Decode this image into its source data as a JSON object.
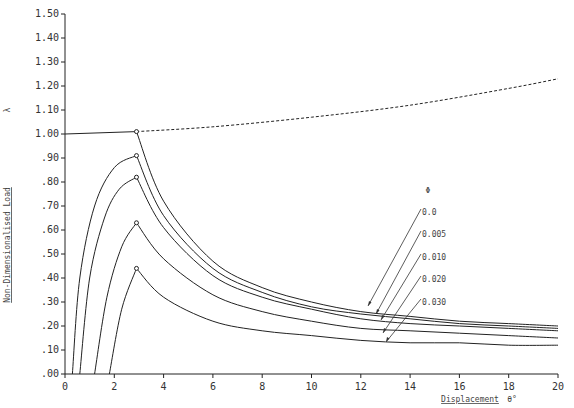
{
  "chart_data": {
    "type": "line",
    "title": "",
    "xlabel": "Displacement",
    "xlabel_unit": "θ°",
    "ylabel": "Non-Dimensionalised Load",
    "ylabel_symbol": "λ",
    "xlim": [
      0,
      20
    ],
    "ylim": [
      0,
      1.5
    ],
    "x_ticks": [
      "0",
      "2",
      "4",
      "6",
      "8",
      "10",
      "12",
      "14",
      "16",
      "18",
      "20"
    ],
    "y_ticks": [
      ".00",
      ".10",
      ".20",
      ".30",
      ".40",
      ".50",
      ".60",
      ".70",
      ".80",
      ".90",
      "1.00",
      "1.10",
      "1.20",
      "1.30",
      "1.40",
      "1.50"
    ],
    "grid": false,
    "legend": {
      "title": "Φ",
      "entries": [
        "0.0",
        "0.005",
        "0.010",
        "0.020",
        "0.030"
      ],
      "position": "right, with leader arrows to curves"
    },
    "series": [
      {
        "name": "perfect (Φ=0) pre-buckling",
        "style": "solid",
        "x": [
          0,
          2.9
        ],
        "y": [
          1.0,
          1.01
        ]
      },
      {
        "name": "post-buckling rising path",
        "style": "dashed",
        "x": [
          2.9,
          6,
          10,
          14,
          18,
          20
        ],
        "y": [
          1.01,
          1.03,
          1.07,
          1.12,
          1.19,
          1.23
        ]
      },
      {
        "name": "0.0",
        "style": "solid",
        "x": [
          2.9,
          4,
          6,
          8,
          10,
          12,
          14,
          16,
          18,
          20
        ],
        "y": [
          1.01,
          0.72,
          0.47,
          0.36,
          0.3,
          0.26,
          0.24,
          0.22,
          0.21,
          0.2
        ]
      },
      {
        "name": "0.005",
        "style": "solid",
        "x": [
          0.3,
          0.6,
          1.2,
          2.0,
          2.9,
          4,
          6,
          8,
          10,
          12,
          14,
          16,
          18,
          20
        ],
        "y": [
          0.0,
          0.4,
          0.7,
          0.86,
          0.91,
          0.66,
          0.44,
          0.34,
          0.28,
          0.25,
          0.23,
          0.21,
          0.2,
          0.19
        ]
      },
      {
        "name": "0.010",
        "style": "solid",
        "x": [
          0.6,
          1.0,
          1.6,
          2.2,
          2.9,
          4,
          6,
          8,
          10,
          12,
          14,
          16,
          18,
          20
        ],
        "y": [
          0.0,
          0.4,
          0.65,
          0.77,
          0.82,
          0.61,
          0.41,
          0.32,
          0.27,
          0.23,
          0.21,
          0.2,
          0.19,
          0.18
        ]
      },
      {
        "name": "0.020",
        "style": "solid",
        "x": [
          1.2,
          1.7,
          2.3,
          2.9,
          4,
          6,
          8,
          10,
          12,
          14,
          16,
          18,
          20
        ],
        "y": [
          0.0,
          0.32,
          0.53,
          0.63,
          0.48,
          0.33,
          0.26,
          0.22,
          0.19,
          0.18,
          0.17,
          0.16,
          0.15
        ]
      },
      {
        "name": "0.030",
        "style": "solid",
        "x": [
          1.8,
          2.3,
          2.9,
          4,
          6,
          8,
          10,
          12,
          14,
          16,
          18,
          20
        ],
        "y": [
          0.0,
          0.27,
          0.44,
          0.32,
          0.22,
          0.18,
          0.16,
          0.14,
          0.13,
          0.13,
          0.12,
          0.12
        ]
      }
    ],
    "peak_markers": [
      {
        "x": 2.9,
        "y": 1.01
      },
      {
        "x": 2.9,
        "y": 0.91
      },
      {
        "x": 2.9,
        "y": 0.82
      },
      {
        "x": 2.9,
        "y": 0.63
      },
      {
        "x": 2.9,
        "y": 0.44
      }
    ]
  }
}
